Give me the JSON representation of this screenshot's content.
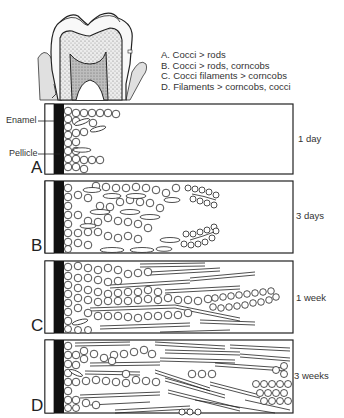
{
  "figure": {
    "legend": [
      "A. Cocci > rods",
      "B. Cocci > rods, corncobs",
      "C. Cocci filaments > corncobs",
      "D. Filaments > corncobs, cocci"
    ],
    "structure_labels": {
      "enamel": "Enamel",
      "pellicle": "Pellicle"
    },
    "panels": [
      {
        "letter": "A",
        "time": "1 day"
      },
      {
        "letter": "B",
        "time": "3 days"
      },
      {
        "letter": "C",
        "time": "1 week"
      },
      {
        "letter": "D",
        "time": "3 weeks"
      }
    ]
  }
}
